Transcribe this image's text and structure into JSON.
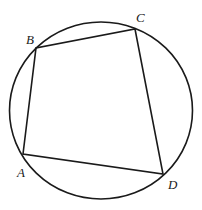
{
  "diagram": {
    "type": "cyclic-quadrilateral-inscribed-in-circle",
    "stroke_color": "#1a1a1a",
    "background": "#ffffff",
    "circle": {
      "cx": 101,
      "cy": 110.5,
      "rx": 91.5,
      "ry": 88.5
    },
    "vertices": {
      "A": {
        "x": 23,
        "y": 154
      },
      "B": {
        "x": 36,
        "y": 48
      },
      "C": {
        "x": 135,
        "y": 29
      },
      "D": {
        "x": 163,
        "y": 174
      }
    },
    "labels": {
      "A": {
        "text": "A",
        "x": 17,
        "y": 177
      },
      "B": {
        "text": "B",
        "x": 26,
        "y": 44
      },
      "C": {
        "text": "C",
        "x": 136,
        "y": 22
      },
      "D": {
        "text": "D",
        "x": 168,
        "y": 189
      }
    },
    "edges": [
      [
        "A",
        "B"
      ],
      [
        "B",
        "C"
      ],
      [
        "C",
        "D"
      ],
      [
        "D",
        "A"
      ]
    ]
  }
}
